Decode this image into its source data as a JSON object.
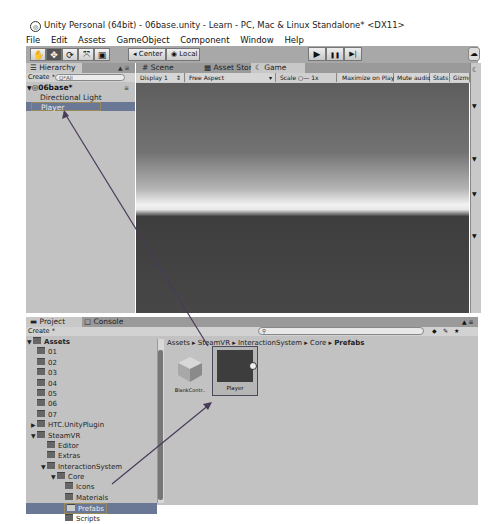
{
  "window": {
    "title": "Unity Personal (64bit) - 06base.unity - Learn - PC, Mac & Linux Standalone* <DX11>"
  },
  "menu": [
    "File",
    "Edit",
    "Assets",
    "GameObject",
    "Component",
    "Window",
    "Help"
  ],
  "toolbar": {
    "tools": [
      {
        "name": "hand-tool",
        "glyph": "✋"
      },
      {
        "name": "move-tool",
        "glyph": "✥"
      },
      {
        "name": "rotate-tool",
        "glyph": "⟳"
      },
      {
        "name": "scale-tool",
        "glyph": "⤧"
      },
      {
        "name": "rect-tool",
        "glyph": "▣"
      }
    ],
    "active_tool": "move-tool",
    "pivot_label": "Center",
    "space_label": "Local",
    "play_glyph": "▶",
    "pause_glyph": "❚❚",
    "step_glyph": "▶|",
    "cloud_glyph": "☁"
  },
  "hierarchy": {
    "tab_label": "Hierarchy",
    "create_label": "Create *",
    "search_placeholder": "Q*All",
    "scene_name": "06base*",
    "items": [
      "Directional Light",
      "Player"
    ],
    "selected_item": "Player"
  },
  "scene_tabs": [
    {
      "label": "Scene",
      "icon": "#"
    },
    {
      "label": "Asset Store",
      "icon": "▦"
    },
    {
      "label": "Game",
      "icon": "☾",
      "selected": true
    }
  ],
  "game_toolbar": {
    "display": "Display 1",
    "aspect": "Free Aspect",
    "scale_label": "Scale",
    "scale_value": "1x",
    "buttons": [
      "Maximize on Play",
      "Mute audio",
      "Stats",
      "Gizmos"
    ]
  },
  "project": {
    "tabs": [
      {
        "label": "Project",
        "selected": true
      },
      {
        "label": "Console",
        "selected": false
      }
    ],
    "create_label": "Create *",
    "tree": [
      {
        "label": "Assets",
        "depth": 0,
        "expanded": true,
        "bold": true
      },
      {
        "label": "01",
        "depth": 1
      },
      {
        "label": "02",
        "depth": 1
      },
      {
        "label": "03",
        "depth": 1
      },
      {
        "label": "04",
        "depth": 1
      },
      {
        "label": "05",
        "depth": 1
      },
      {
        "label": "06",
        "depth": 1
      },
      {
        "label": "07",
        "depth": 1
      },
      {
        "label": "HTC.UnityPlugin",
        "depth": 1,
        "collapsed": true
      },
      {
        "label": "SteamVR",
        "depth": 1,
        "expanded": true
      },
      {
        "label": "Editor",
        "depth": 2
      },
      {
        "label": "Extras",
        "depth": 2
      },
      {
        "label": "InteractionSystem",
        "depth": 2,
        "expanded": true
      },
      {
        "label": "Core",
        "depth": 3,
        "expanded": true
      },
      {
        "label": "Icons",
        "depth": 4
      },
      {
        "label": "Materials",
        "depth": 4
      },
      {
        "label": "Prefabs",
        "depth": 4,
        "selected": true
      },
      {
        "label": "Scripts",
        "depth": 4
      }
    ],
    "breadcrumb": [
      "Assets",
      "SteamVR",
      "InteractionSystem",
      "Core",
      "Prefabs"
    ],
    "assets": [
      {
        "label": "BlankContr..",
        "type": "prefab"
      },
      {
        "label": "Player",
        "type": "prefab",
        "selected": true
      }
    ]
  },
  "colors": {
    "accent_selection": "#4d6da0",
    "annotation_box": "#8a7a5a",
    "arrow": "#5a3a6a"
  }
}
